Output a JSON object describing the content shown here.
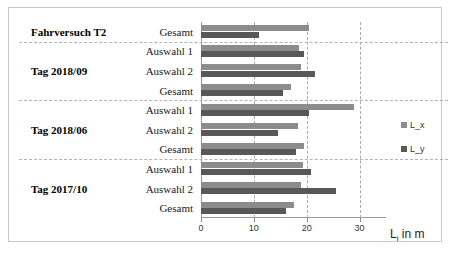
{
  "chart_data": {
    "type": "bar",
    "orientation": "horizontal",
    "title": "",
    "xlabel": "L_i in m",
    "ylabel": "",
    "xlim": [
      0,
      35
    ],
    "xticks": [
      0,
      10,
      20,
      30
    ],
    "xticklabels": [
      "0",
      "10",
      "20",
      "30"
    ],
    "grid": true,
    "legend_position": "right",
    "series": [
      {
        "name": "L_x",
        "color": "#8c8c8c"
      },
      {
        "name": "L_y",
        "color": "#585858"
      }
    ],
    "groups": [
      {
        "group_label": "Fahrversuch T2",
        "rows": [
          {
            "category": "Gesamt",
            "L_x": 20.5,
            "L_y": 11.0
          }
        ]
      },
      {
        "group_label": "Tag 2018/09",
        "rows": [
          {
            "category": "Auswahl 1",
            "L_x": 18.5,
            "L_y": 19.5
          },
          {
            "category": "Auswahl 2",
            "L_x": 19.0,
            "L_y": 21.5
          },
          {
            "category": "Gesamt",
            "L_x": 17.0,
            "L_y": 15.5
          }
        ]
      },
      {
        "group_label": "Tag 2018/06",
        "rows": [
          {
            "category": "Auswahl 1",
            "L_x": 29.0,
            "L_y": 20.5
          },
          {
            "category": "Auswahl 2",
            "L_x": 18.3,
            "L_y": 14.5
          },
          {
            "category": "Gesamt",
            "L_x": 19.5,
            "L_y": 18.0
          }
        ]
      },
      {
        "group_label": "Tag 2017/10",
        "rows": [
          {
            "category": "Auswahl 1",
            "L_x": 19.3,
            "L_y": 20.8
          },
          {
            "category": "Auswahl 2",
            "L_x": 19.0,
            "L_y": 25.5
          },
          {
            "category": "Gesamt",
            "L_x": 17.5,
            "L_y": 16.0
          }
        ]
      }
    ]
  },
  "axis": {
    "title_main": "L",
    "title_sub": "i",
    "title_tail": " in m"
  }
}
